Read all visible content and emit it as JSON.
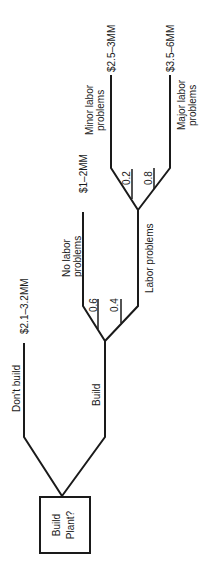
{
  "diagram": {
    "type": "decision-tree",
    "orientation": "rotated-90-ccw",
    "root": {
      "label_line1": "Build",
      "label_line2": "Plant?"
    },
    "branches": {
      "dont_build": {
        "label": "Don't build",
        "payoff": "$2.1–3.2MM"
      },
      "build": {
        "label": "Build"
      },
      "no_labor": {
        "label_line1": "No labor",
        "label_line2": "problems",
        "prob": "0.6",
        "payoff": "$1–2MM"
      },
      "labor": {
        "label": "Labor problems",
        "prob": "0.4"
      },
      "minor": {
        "label_line1": "Minor labor",
        "label_line2": "problems",
        "prob": "0.2",
        "payoff": "$2.5–3MM"
      },
      "major": {
        "label_line1": "Major labor",
        "label_line2": "problems",
        "prob": "0.8",
        "payoff": "$3.5–6MM"
      }
    },
    "colors": {
      "line": "#1a1a1a",
      "background": "#ffffff"
    }
  }
}
